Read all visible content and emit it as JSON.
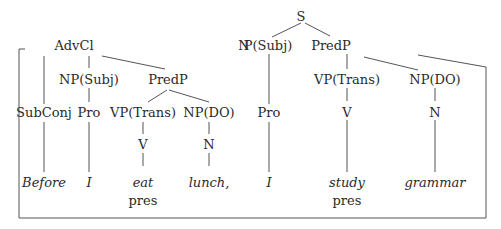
{
  "diagram": {
    "type": "syntax-tree",
    "line_color": "#555555",
    "text_color": "#2a2a2a",
    "root": "S",
    "main_clause": {
      "subject": {
        "label": "P(Subj)",
        "prefix": "N",
        "child": "Pro",
        "word": "I"
      },
      "predicate": {
        "label": "PredP",
        "verb_phrase": {
          "label": "VP(Trans)",
          "child": "V",
          "word": "study",
          "tense": "pres"
        },
        "object": {
          "label": "NP(DO)",
          "child": "N",
          "word": "grammar"
        }
      }
    },
    "adverbial_clause": {
      "label": "AdvCl",
      "subconj": {
        "label": "SubConj",
        "word": "Before"
      },
      "subject": {
        "label": "NP(Subj)",
        "child": "Pro",
        "word": "I"
      },
      "predicate": {
        "label": "PredP",
        "verb_phrase": {
          "label": "VP(Trans)",
          "child": "V",
          "word": "eat",
          "tense": "pres"
        },
        "object": {
          "label": "NP(DO)",
          "child": "N",
          "word": "lunch,"
        }
      }
    }
  }
}
